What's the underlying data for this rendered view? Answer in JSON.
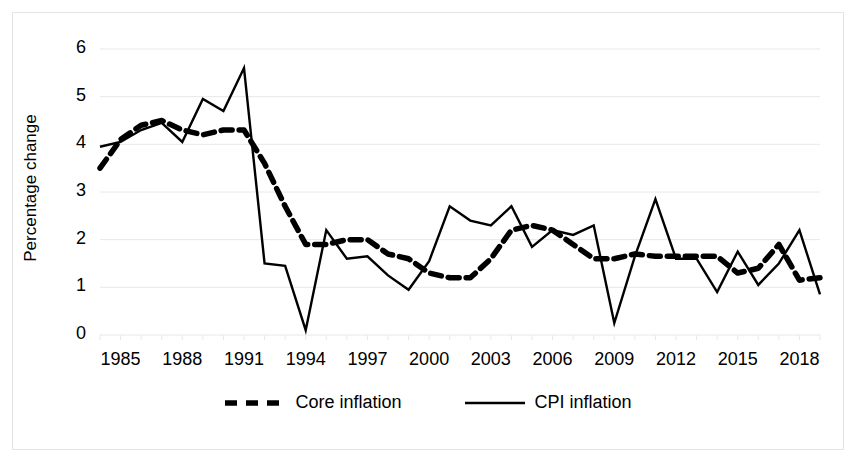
{
  "chart_data": {
    "type": "line",
    "title": "",
    "xlabel": "",
    "ylabel": "Percentage change",
    "ylim": [
      0,
      6
    ],
    "yticks": [
      0,
      1,
      2,
      3,
      4,
      5,
      6
    ],
    "xlim": [
      1984,
      2019
    ],
    "xticks": [
      1985,
      1988,
      1991,
      1994,
      1997,
      2000,
      2003,
      2006,
      2009,
      2012,
      2015,
      2018
    ],
    "grid": true,
    "grid_axis": "y",
    "legend_position": "bottom",
    "x": [
      1984,
      1985,
      1986,
      1987,
      1988,
      1989,
      1990,
      1991,
      1992,
      1993,
      1994,
      1995,
      1996,
      1997,
      1998,
      1999,
      2000,
      2001,
      2002,
      2003,
      2004,
      2005,
      2006,
      2007,
      2008,
      2009,
      2010,
      2011,
      2012,
      2013,
      2014,
      2015,
      2016,
      2017,
      2018,
      2019
    ],
    "series": [
      {
        "name": "Core inflation",
        "style": "dashed",
        "color": "#000000",
        "values": [
          3.5,
          4.1,
          4.4,
          4.5,
          4.3,
          4.2,
          4.3,
          4.3,
          3.6,
          2.7,
          1.9,
          1.9,
          2.0,
          2.0,
          1.7,
          1.6,
          1.3,
          1.2,
          1.2,
          1.6,
          2.2,
          2.3,
          2.2,
          1.9,
          1.6,
          1.6,
          1.7,
          1.65,
          1.65,
          1.65,
          1.65,
          1.3,
          1.4,
          1.9,
          1.15,
          1.2
        ]
      },
      {
        "name": "CPI inflation",
        "style": "solid",
        "color": "#000000",
        "values": [
          3.95,
          4.05,
          4.3,
          4.45,
          4.05,
          4.95,
          4.7,
          5.6,
          1.5,
          1.45,
          0.1,
          2.2,
          1.6,
          1.65,
          1.25,
          0.95,
          1.55,
          2.7,
          2.4,
          2.3,
          2.7,
          1.85,
          2.2,
          2.1,
          2.3,
          0.25,
          1.65,
          2.85,
          1.6,
          1.6,
          0.9,
          1.75,
          1.05,
          1.5,
          2.2,
          0.85
        ]
      }
    ]
  },
  "axis": {
    "ylabel": "Percentage change",
    "yticks": [
      "6",
      "5",
      "4",
      "3",
      "2",
      "1",
      "0"
    ],
    "xticks": [
      "1985",
      "1988",
      "1991",
      "1994",
      "1997",
      "2000",
      "2003",
      "2006",
      "2009",
      "2012",
      "2015",
      "2018"
    ]
  },
  "legend": {
    "entries": [
      {
        "label": "Core inflation",
        "style": "dashed"
      },
      {
        "label": "CPI inflation",
        "style": "solid"
      }
    ]
  },
  "colors": {
    "series": "#000000",
    "grid": "#e8e8e8",
    "frame": "#e4e4e4",
    "background": "#ffffff"
  }
}
